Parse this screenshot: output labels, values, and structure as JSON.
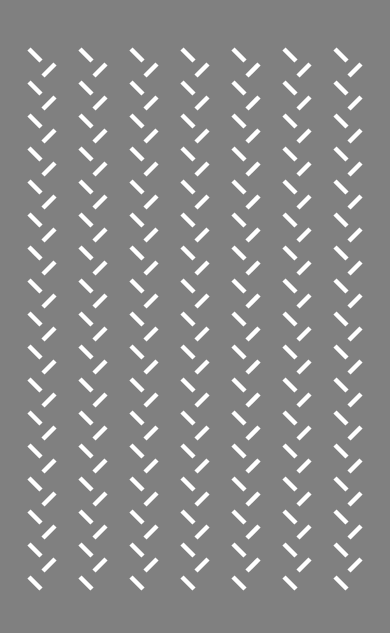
{
  "pattern": {
    "background": "#808080",
    "dash_color": "#ffffff",
    "dash_width": 4.5,
    "columns_x": [
      29,
      80,
      131,
      182,
      233,
      284,
      335
    ],
    "first_y": 49,
    "period_y": 33,
    "back_slash_count": 17,
    "forward_slash_count": 16,
    "back_slash": {
      "dx1": 0,
      "dy1": 0,
      "dx2": 12,
      "dy2": 12
    },
    "forward_slash": {
      "dx1": 14,
      "dy1": 27,
      "dx2": 26,
      "dy2": 15
    }
  }
}
